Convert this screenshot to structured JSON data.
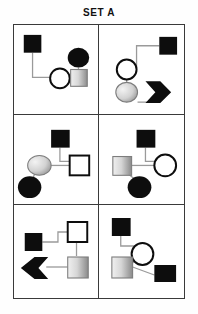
{
  "title": "SET A",
  "colors": {
    "filled": "#0d0d0d",
    "open_fill": "#ffffff",
    "outline": "#0d0d0d",
    "gray_light": "#e2e2e2",
    "gray_dark": "#8f8f8f",
    "link": "#9a9a9a",
    "grid_border": "#3a3a3a",
    "background": "#ffffff",
    "title_color": "#111111"
  },
  "grid": {
    "rows": 3,
    "columns": 2,
    "panel_count": 6
  },
  "panels": [
    {
      "id": "panel-1",
      "position": "top-left",
      "shapes": [
        {
          "name": "filled-square",
          "shape": "square",
          "fill": "filled"
        },
        {
          "name": "filled-circle",
          "shape": "circle",
          "fill": "filled"
        },
        {
          "name": "open-circle",
          "shape": "circle",
          "fill": "open"
        },
        {
          "name": "gradient-square",
          "shape": "square",
          "fill": "gradient"
        }
      ],
      "link_count": 3
    },
    {
      "id": "panel-2",
      "position": "top-right",
      "shapes": [
        {
          "name": "filled-square",
          "shape": "square",
          "fill": "filled"
        },
        {
          "name": "open-circle",
          "shape": "circle",
          "fill": "open"
        },
        {
          "name": "gradient-circle",
          "shape": "circle",
          "fill": "gradient"
        },
        {
          "name": "right-arrow",
          "shape": "arrow-right",
          "fill": "filled"
        }
      ],
      "link_count": 3
    },
    {
      "id": "panel-3",
      "position": "middle-left",
      "shapes": [
        {
          "name": "filled-square",
          "shape": "square",
          "fill": "filled"
        },
        {
          "name": "gradient-circle",
          "shape": "circle",
          "fill": "gradient"
        },
        {
          "name": "open-square",
          "shape": "square",
          "fill": "open"
        },
        {
          "name": "filled-circle",
          "shape": "circle",
          "fill": "filled"
        }
      ],
      "link_count": 3
    },
    {
      "id": "panel-4",
      "position": "middle-right",
      "shapes": [
        {
          "name": "filled-square",
          "shape": "square",
          "fill": "filled"
        },
        {
          "name": "gradient-square",
          "shape": "square",
          "fill": "gradient"
        },
        {
          "name": "open-circle",
          "shape": "circle",
          "fill": "open"
        },
        {
          "name": "filled-circle",
          "shape": "circle",
          "fill": "filled"
        }
      ],
      "link_count": 3
    },
    {
      "id": "panel-5",
      "position": "bottom-left",
      "shapes": [
        {
          "name": "open-square",
          "shape": "square",
          "fill": "open"
        },
        {
          "name": "filled-square",
          "shape": "square",
          "fill": "filled"
        },
        {
          "name": "gradient-square",
          "shape": "square",
          "fill": "gradient"
        },
        {
          "name": "left-arrow",
          "shape": "arrow-left",
          "fill": "filled"
        }
      ],
      "link_count": 3
    },
    {
      "id": "panel-6",
      "position": "bottom-right",
      "shapes": [
        {
          "name": "filled-square",
          "shape": "square",
          "fill": "filled"
        },
        {
          "name": "open-circle",
          "shape": "circle",
          "fill": "open"
        },
        {
          "name": "gradient-square",
          "shape": "square",
          "fill": "gradient"
        },
        {
          "name": "filled-square-2",
          "shape": "square",
          "fill": "filled"
        }
      ],
      "link_count": 3
    }
  ]
}
